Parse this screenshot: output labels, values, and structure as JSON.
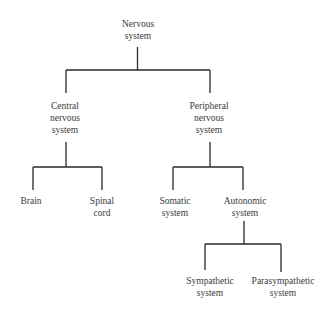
{
  "diagram": {
    "type": "tree",
    "title": "Nervous system",
    "line_color": "#2a2a2a",
    "nodes": {
      "root": {
        "l1": "Nervous",
        "l2": "system"
      },
      "cns": {
        "l1": "Central",
        "l2": "nervous",
        "l3": "system"
      },
      "pns": {
        "l1": "Peripheral",
        "l2": "nervous",
        "l3": "system"
      },
      "brain": {
        "l1": "Brain"
      },
      "spinal": {
        "l1": "Spinal",
        "l2": "cord"
      },
      "somatic": {
        "l1": "Somatic",
        "l2": "system"
      },
      "autonomic": {
        "l1": "Autonomic",
        "l2": "system"
      },
      "sympathetic": {
        "l1": "Sympathetic",
        "l2": "system"
      },
      "parasympathetic": {
        "l1": "Parasympathetic",
        "l2": "system"
      }
    },
    "edges": [
      [
        "Nervous system",
        "Central nervous system"
      ],
      [
        "Nervous system",
        "Peripheral nervous system"
      ],
      [
        "Central nervous system",
        "Brain"
      ],
      [
        "Central nervous system",
        "Spinal cord"
      ],
      [
        "Peripheral nervous system",
        "Somatic system"
      ],
      [
        "Peripheral nervous system",
        "Autonomic system"
      ],
      [
        "Autonomic system",
        "Sympathetic system"
      ],
      [
        "Autonomic system",
        "Parasympathetic system"
      ]
    ]
  }
}
